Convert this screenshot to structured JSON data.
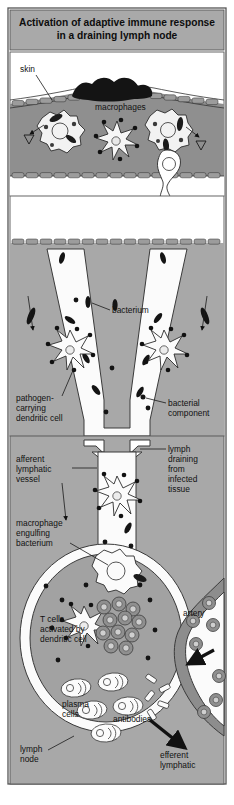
{
  "figure": {
    "title_line1": "Activation of adaptive immune response",
    "title_line2": "in a draining lymph node",
    "title_bar_color": "#a9a9a9",
    "border_color": "#555555",
    "background": "#ffffff"
  },
  "palette": {
    "tissue_gray": "#a8a8a8",
    "dermis_gray": "#8f8f8f",
    "node_cortex": "#a2a2a2",
    "lumen_white": "#fbfbfb",
    "scab_black": "#141414",
    "cell_gray": "#9a9a9a",
    "artery_gray": "#8d8d8d",
    "outline": "#333333"
  },
  "panels": [
    {
      "name": "title-panel",
      "label": "Activation of adaptive immune response in a draining lymph node"
    },
    {
      "name": "skin-panel",
      "label": "skin and dermis with infection site"
    },
    {
      "name": "vessel-panel",
      "label": "afferent lymphatic vessels carrying dendritic cells"
    },
    {
      "name": "node-panel",
      "label": "draining lymph node with T cells and plasma cells"
    }
  ],
  "labels": [
    {
      "id": "skin",
      "text": "skin"
    },
    {
      "id": "macrophages",
      "text": "macrophages"
    },
    {
      "id": "bacterium",
      "text": "bacterium"
    },
    {
      "id": "pathogen_dc_l1",
      "text": "pathogen-"
    },
    {
      "id": "pathogen_dc_l2",
      "text": "carrying"
    },
    {
      "id": "pathogen_dc_l3",
      "text": "dendritic cell"
    },
    {
      "id": "bacterial_comp_l1",
      "text": "bacterial"
    },
    {
      "id": "bacterial_comp_l2",
      "text": "component"
    },
    {
      "id": "afferent_l1",
      "text": "afferent"
    },
    {
      "id": "afferent_l2",
      "text": "lymphatic"
    },
    {
      "id": "afferent_l3",
      "text": "vessel"
    },
    {
      "id": "lymph_drain_l1",
      "text": "lymph"
    },
    {
      "id": "lymph_drain_l2",
      "text": "draining"
    },
    {
      "id": "lymph_drain_l3",
      "text": "from"
    },
    {
      "id": "lymph_drain_l4",
      "text": "infected"
    },
    {
      "id": "lymph_drain_l5",
      "text": "tissue"
    },
    {
      "id": "mac_engulf_l1",
      "text": "macrophage"
    },
    {
      "id": "mac_engulf_l2",
      "text": "engulfing"
    },
    {
      "id": "mac_engulf_l3",
      "text": "bacterium"
    },
    {
      "id": "tcells_l1",
      "text": "T cells"
    },
    {
      "id": "tcells_l2",
      "text": "activated by"
    },
    {
      "id": "tcells_l3",
      "text": "dendritic cell"
    },
    {
      "id": "artery",
      "text": "artery"
    },
    {
      "id": "plasma_l1",
      "text": "plasma"
    },
    {
      "id": "plasma_l2",
      "text": "cells"
    },
    {
      "id": "antibodies",
      "text": "antibodies"
    },
    {
      "id": "lymph_node_l1",
      "text": "lymph"
    },
    {
      "id": "lymph_node_l2",
      "text": "node"
    },
    {
      "id": "efferent_l1",
      "text": "efferent"
    },
    {
      "id": "efferent_l2",
      "text": "lymphatic"
    }
  ]
}
